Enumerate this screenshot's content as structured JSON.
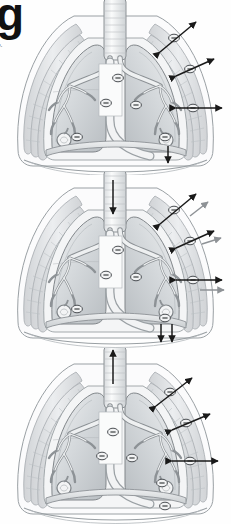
{
  "figure": {
    "crop_letter": "g",
    "crop_text_fragment": "e.",
    "kind": "anatomical-illustration",
    "panel_count": 3,
    "palette": {
      "background": "#ffffff",
      "outline": "#6e7276",
      "lung_fill_light": "#e6e8ea",
      "lung_fill_mid": "#cfd3d6",
      "lung_fill_dark": "#b4b9bd",
      "ribcage": "#d8dadc",
      "airway": "#eceef0",
      "arrow_primary": "#1a1a1a",
      "arrow_secondary": "#8e9296",
      "marker_stroke": "#4a4e52",
      "marker_fill": "#f2f3f4"
    }
  },
  "panels": [
    {
      "id": "panel-rest",
      "name": "panel-rest",
      "phase_label": "rest",
      "trachea_arrow": "none",
      "diaphragm_arrows": [
        "down"
      ],
      "pressure_markers": 8,
      "side_arrow_pairs": 3,
      "secondary_arrows": 0
    },
    {
      "id": "panel-inhale",
      "name": "panel-inhalation",
      "phase_label": "inhalation",
      "trachea_arrow": "down",
      "diaphragm_arrows": [
        "down",
        "down"
      ],
      "pressure_markers": 8,
      "side_arrow_pairs": 3,
      "secondary_arrows": 3
    },
    {
      "id": "panel-exhale",
      "name": "panel-exhalation",
      "phase_label": "exhalation",
      "trachea_arrow": "up",
      "diaphragm_arrows": [],
      "pressure_markers": 8,
      "side_arrow_pairs": 3,
      "secondary_arrows": 0
    }
  ],
  "markers": {
    "glyph": "−",
    "meaning": "negative-pressure",
    "shape": "ellipse"
  },
  "structures": [
    "trachea",
    "main-bronchi",
    "bronchial-tree",
    "left-lung",
    "right-lung",
    "ribcage",
    "diaphragm",
    "pleural-space",
    "alveolus"
  ]
}
